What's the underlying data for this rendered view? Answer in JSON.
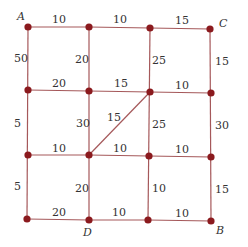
{
  "diagram": {
    "type": "weighted-grid-graph",
    "node_color": "#8b1a1e",
    "edge_color": "#a5585a",
    "columns_x": [
      28,
      89,
      150,
      210
    ],
    "rows_y": [
      27,
      91,
      155,
      219
    ],
    "named_nodes": {
      "A": {
        "label": "A",
        "col": 0,
        "row": 0
      },
      "C": {
        "label": "C",
        "col": 3,
        "row": 0
      },
      "D": {
        "label": "D",
        "col": 1,
        "row": 3
      },
      "B": {
        "label": "B",
        "col": 3,
        "row": 3
      }
    },
    "horizontal_edges": [
      {
        "row": 0,
        "from_col": 0,
        "to_col": 1,
        "weight": "10"
      },
      {
        "row": 0,
        "from_col": 1,
        "to_col": 2,
        "weight": "10"
      },
      {
        "row": 0,
        "from_col": 2,
        "to_col": 3,
        "weight": "15"
      },
      {
        "row": 1,
        "from_col": 0,
        "to_col": 1,
        "weight": "20"
      },
      {
        "row": 1,
        "from_col": 1,
        "to_col": 2,
        "weight": "15"
      },
      {
        "row": 1,
        "from_col": 2,
        "to_col": 3,
        "weight": "10"
      },
      {
        "row": 2,
        "from_col": 0,
        "to_col": 1,
        "weight": "10"
      },
      {
        "row": 2,
        "from_col": 1,
        "to_col": 2,
        "weight": "10"
      },
      {
        "row": 2,
        "from_col": 2,
        "to_col": 3,
        "weight": "10"
      },
      {
        "row": 3,
        "from_col": 0,
        "to_col": 1,
        "weight": "20"
      },
      {
        "row": 3,
        "from_col": 1,
        "to_col": 2,
        "weight": "10"
      },
      {
        "row": 3,
        "from_col": 2,
        "to_col": 3,
        "weight": "10"
      }
    ],
    "vertical_edges": [
      {
        "col": 0,
        "from_row": 0,
        "to_row": 1,
        "weight": "50"
      },
      {
        "col": 0,
        "from_row": 1,
        "to_row": 2,
        "weight": "5"
      },
      {
        "col": 0,
        "from_row": 2,
        "to_row": 3,
        "weight": "5"
      },
      {
        "col": 1,
        "from_row": 0,
        "to_row": 1,
        "weight": "20"
      },
      {
        "col": 1,
        "from_row": 1,
        "to_row": 2,
        "weight": "30"
      },
      {
        "col": 1,
        "from_row": 2,
        "to_row": 3,
        "weight": "20"
      },
      {
        "col": 2,
        "from_row": 0,
        "to_row": 1,
        "weight": "25"
      },
      {
        "col": 2,
        "from_row": 1,
        "to_row": 2,
        "weight": "25"
      },
      {
        "col": 2,
        "from_row": 2,
        "to_row": 3,
        "weight": "10"
      },
      {
        "col": 3,
        "from_row": 0,
        "to_row": 1,
        "weight": "15"
      },
      {
        "col": 3,
        "from_row": 1,
        "to_row": 2,
        "weight": "30"
      },
      {
        "col": 3,
        "from_row": 2,
        "to_row": 3,
        "weight": "15"
      }
    ],
    "diagonal_edges": [
      {
        "from": {
          "col": 1,
          "row": 2
        },
        "to": {
          "col": 2,
          "row": 1
        },
        "weight": "15"
      }
    ]
  }
}
